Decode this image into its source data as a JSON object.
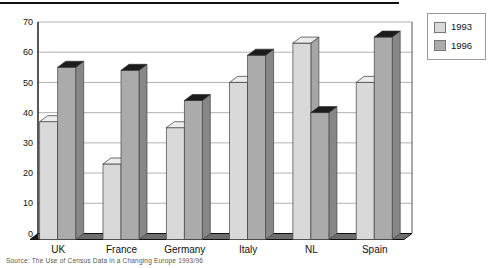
{
  "chart_data": {
    "type": "bar",
    "style": "3d-column",
    "title": "",
    "xlabel": "",
    "ylabel": "",
    "categories": [
      "UK",
      "France",
      "Germany",
      "Italy",
      "NL",
      "Spain"
    ],
    "series": [
      {
        "name": "1993",
        "values": [
          39,
          25,
          37,
          52,
          65,
          52
        ],
        "front_color": "#d9d9d9",
        "side_color": "#a6a6a6",
        "top_color": "#ececec"
      },
      {
        "name": "1996",
        "values": [
          57,
          56,
          46,
          61,
          42,
          67
        ],
        "front_color": "#ababab",
        "side_color": "#878787",
        "top_color": "#1c1c1c"
      }
    ],
    "ylim": [
      0,
      70
    ],
    "yticks": [
      0,
      10,
      20,
      30,
      40,
      50,
      60,
      70
    ],
    "grid": true,
    "legend_position": "top-right"
  },
  "legend": {
    "items": [
      {
        "label": "1993",
        "color": "#d9d9d9"
      },
      {
        "label": "1996",
        "color": "#ababab"
      }
    ]
  },
  "caption": {
    "text": "Source: The Use of Census Data in a Changing Europe 1993/96"
  },
  "colors": {
    "gridline": "#b3b3b3",
    "axis": "#111111",
    "wall_edge": "#555555",
    "floor": "#6e6e6e",
    "background": "#ffffff",
    "tick_text": "#111111"
  }
}
